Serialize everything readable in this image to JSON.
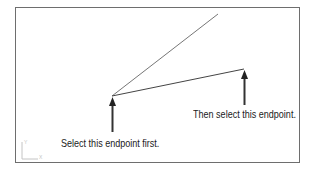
{
  "diagram": {
    "labels": {
      "first": "Select this endpoint first.",
      "then": "Then select this endpoint."
    },
    "ucs_icon": {
      "y_label": "Y",
      "x_label": "X"
    },
    "colors": {
      "line": "#555555",
      "arrow": "#333333",
      "frame": "#6e6e6e",
      "ucs": "#c8c8c8"
    }
  }
}
